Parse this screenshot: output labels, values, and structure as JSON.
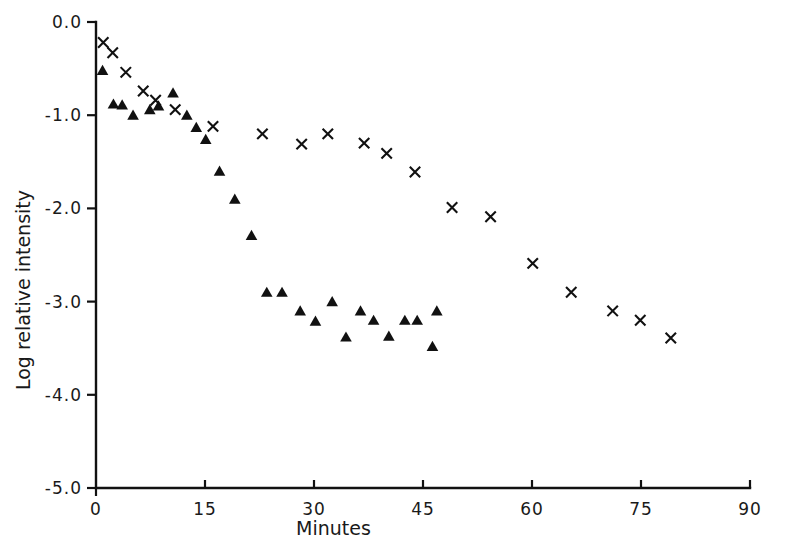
{
  "chart_data": {
    "type": "scatter",
    "title": "",
    "xlabel": "Minutes",
    "ylabel": "Log relative intensity",
    "xlim": [
      0,
      90
    ],
    "ylim": [
      -5.0,
      0.0
    ],
    "xticks": [
      0,
      15,
      30,
      45,
      60,
      75,
      90
    ],
    "xticklabels": [
      "0",
      "15",
      "30",
      "45",
      "60",
      "75",
      "90"
    ],
    "yticks": [
      0.0,
      -1.0,
      -2.0,
      -3.0,
      -4.0,
      -5.0
    ],
    "yticklabels": [
      "0.0",
      "-1.0",
      "-2.0",
      "-3.0",
      "-4.0",
      "-5.0"
    ],
    "grid": false,
    "legend": "none",
    "series": [
      {
        "name": "cross-series",
        "marker": "x",
        "color": "#111111",
        "points": [
          [
            1.0,
            -0.22
          ],
          [
            2.3,
            -0.33
          ],
          [
            4.1,
            -0.54
          ],
          [
            6.5,
            -0.74
          ],
          [
            8.2,
            -0.84
          ],
          [
            10.9,
            -0.94
          ],
          [
            16.1,
            -1.12
          ],
          [
            22.9,
            -1.2
          ],
          [
            28.3,
            -1.31
          ],
          [
            31.9,
            -1.2
          ],
          [
            36.9,
            -1.3
          ],
          [
            40.0,
            -1.41
          ],
          [
            43.9,
            -1.61
          ],
          [
            49.0,
            -1.99
          ],
          [
            54.3,
            -2.09
          ],
          [
            60.1,
            -2.59
          ],
          [
            65.4,
            -2.9
          ],
          [
            71.1,
            -3.1
          ],
          [
            74.9,
            -3.2
          ],
          [
            79.1,
            -3.39
          ]
        ]
      },
      {
        "name": "triangle-series",
        "marker": "triangle",
        "color": "#111111",
        "points": [
          [
            0.9,
            -0.52
          ],
          [
            2.4,
            -0.88
          ],
          [
            3.6,
            -0.89
          ],
          [
            5.1,
            -1.0
          ],
          [
            7.4,
            -0.94
          ],
          [
            8.6,
            -0.9
          ],
          [
            10.6,
            -0.76
          ],
          [
            12.5,
            -1.0
          ],
          [
            13.8,
            -1.13
          ],
          [
            15.1,
            -1.26
          ],
          [
            17.0,
            -1.6
          ],
          [
            19.1,
            -1.9
          ],
          [
            21.4,
            -2.29
          ],
          [
            23.5,
            -2.9
          ],
          [
            25.6,
            -2.9
          ],
          [
            28.1,
            -3.1
          ],
          [
            30.2,
            -3.21
          ],
          [
            32.5,
            -3.0
          ],
          [
            34.4,
            -3.38
          ],
          [
            36.4,
            -3.1
          ],
          [
            38.2,
            -3.2
          ],
          [
            40.3,
            -3.37
          ],
          [
            42.5,
            -3.2
          ],
          [
            44.2,
            -3.2
          ],
          [
            46.9,
            -3.1
          ],
          [
            46.3,
            -3.48
          ]
        ]
      }
    ]
  }
}
